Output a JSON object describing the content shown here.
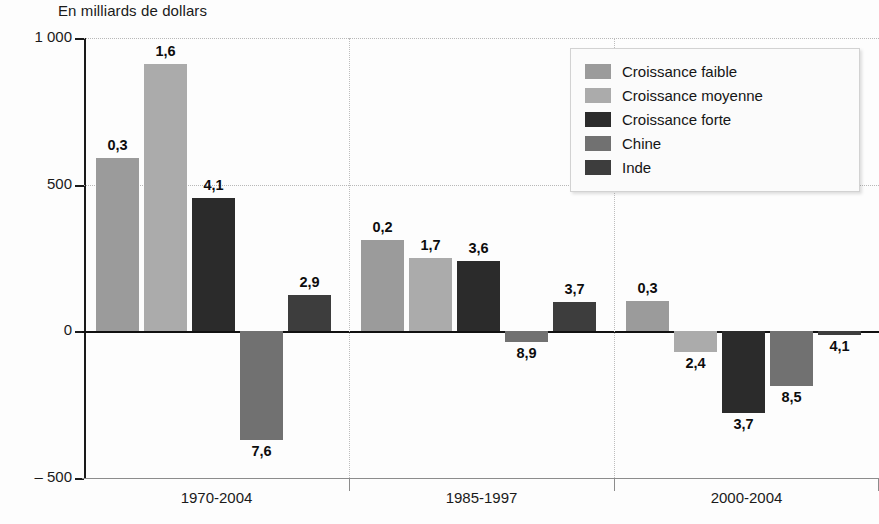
{
  "chart_data": {
    "type": "bar",
    "title": "En milliards de dollars",
    "xlabel": "",
    "ylabel": "En milliards de dollars",
    "ylim": [
      -500,
      1000
    ],
    "yticks": [
      -500,
      0,
      500,
      1000
    ],
    "ytick_labels": [
      "– 500",
      "0",
      "500",
      "1 000"
    ],
    "grid": true,
    "legend_position": "top-right",
    "categories": [
      "1970-2004",
      "1985-1997",
      "2000-2004"
    ],
    "series": [
      {
        "name": "Croissance faible",
        "color": "#9b9b9b",
        "values": [
          590,
          310,
          105
        ],
        "point_labels": [
          "0,3",
          "0,2",
          "0,3"
        ]
      },
      {
        "name": "Croissance moyenne",
        "color": "#ababab",
        "values": [
          910,
          250,
          -70
        ],
        "point_labels": [
          "1,6",
          "1,7",
          "2,4"
        ]
      },
      {
        "name": "Croissance forte",
        "color": "#2b2b2b",
        "values": [
          455,
          240,
          -280
        ],
        "point_labels": [
          "4,1",
          "3,6",
          "3,7"
        ]
      },
      {
        "name": "Chine",
        "color": "#717171",
        "values": [
          -370,
          -35,
          -185
        ],
        "point_labels": [
          "7,6",
          "8,9",
          "8,5"
        ]
      },
      {
        "name": "Inde",
        "color": "#3d3d3d",
        "values": [
          125,
          100,
          -12
        ],
        "point_labels": [
          "2,9",
          "3,7",
          "4,1"
        ]
      }
    ]
  },
  "legend": {
    "items": [
      {
        "label": "Croissance faible",
        "color": "#9b9b9b"
      },
      {
        "label": "Croissance moyenne",
        "color": "#ababab"
      },
      {
        "label": "Croissance forte",
        "color": "#2b2b2b"
      },
      {
        "label": "Chine",
        "color": "#717171"
      },
      {
        "label": "Inde",
        "color": "#3d3d3d"
      }
    ]
  }
}
